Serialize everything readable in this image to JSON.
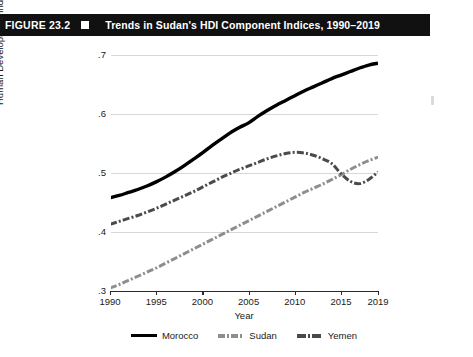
{
  "figure": {
    "number_label": "FIGURE 23.2",
    "marker_icon": "white-square-icon",
    "title": "Trends in Sudan's HDI Component Indices, 1990–2019",
    "band_color": "#111111"
  },
  "chart_data": {
    "type": "line",
    "title": "Trends in Sudan's HDI Component Indices, 1990–2019",
    "xlabel": "Year",
    "ylabel": "Human Development Index",
    "xlim": [
      1990,
      2019
    ],
    "ylim": [
      0.3,
      0.7
    ],
    "grid": "horizontal",
    "legend_position": "bottom",
    "xticks": [
      1990,
      1995,
      2000,
      2005,
      2010,
      2015,
      2019
    ],
    "xtick_labels": [
      "1990",
      "1995",
      "2000",
      "2005",
      "2010",
      "2015",
      "2019"
    ],
    "yticks": [
      0.3,
      0.4,
      0.5,
      0.6,
      0.7
    ],
    "ytick_labels": [
      ".3",
      ".4",
      ".5",
      ".6",
      ".7"
    ],
    "x": [
      1990,
      1991,
      1992,
      1993,
      1994,
      1995,
      1996,
      1997,
      1998,
      1999,
      2000,
      2001,
      2002,
      2003,
      2004,
      2005,
      2006,
      2007,
      2008,
      2009,
      2010,
      2011,
      2012,
      2013,
      2014,
      2015,
      2016,
      2017,
      2018,
      2019
    ],
    "series": [
      {
        "name": "Morocco",
        "color": "#000000",
        "style": "solid",
        "values": [
          0.458,
          0.462,
          0.467,
          0.472,
          0.478,
          0.485,
          0.493,
          0.502,
          0.512,
          0.523,
          0.534,
          0.546,
          0.557,
          0.568,
          0.577,
          0.585,
          0.596,
          0.606,
          0.615,
          0.623,
          0.631,
          0.639,
          0.646,
          0.653,
          0.66,
          0.666,
          0.672,
          0.678,
          0.683,
          0.686
        ]
      },
      {
        "name": "Sudan",
        "color": "#8e8e8e",
        "style": "dash-dot",
        "values": [
          0.305,
          0.311,
          0.318,
          0.325,
          0.332,
          0.339,
          0.347,
          0.355,
          0.363,
          0.371,
          0.379,
          0.387,
          0.395,
          0.403,
          0.411,
          0.419,
          0.427,
          0.435,
          0.443,
          0.451,
          0.459,
          0.467,
          0.474,
          0.481,
          0.489,
          0.497,
          0.506,
          0.514,
          0.521,
          0.527
        ]
      },
      {
        "name": "Yemen",
        "color": "#4a4a4a",
        "style": "dash-dot",
        "values": [
          0.413,
          0.418,
          0.423,
          0.428,
          0.434,
          0.44,
          0.447,
          0.454,
          0.461,
          0.468,
          0.476,
          0.484,
          0.492,
          0.499,
          0.506,
          0.512,
          0.518,
          0.524,
          0.529,
          0.533,
          0.535,
          0.534,
          0.53,
          0.524,
          0.516,
          0.499,
          0.486,
          0.482,
          0.489,
          0.502
        ]
      }
    ]
  },
  "legend": {
    "items": [
      {
        "label": "Morocco",
        "swatch": "morocco-swatch"
      },
      {
        "label": "Sudan",
        "swatch": "sudan-swatch"
      },
      {
        "label": "Yemen",
        "swatch": "yemen-swatch"
      }
    ]
  }
}
